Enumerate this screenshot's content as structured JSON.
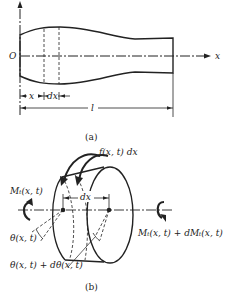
{
  "figure_a": {
    "caption": "(a)",
    "origin_label": "O",
    "axis_label": "x",
    "dim_x": "x",
    "dim_dx": "dx",
    "dim_length": "l"
  },
  "figure_b": {
    "caption": "(b)",
    "distributed_torque": "f(x, t) dx",
    "left_moment": "Mₜ(x, t)",
    "right_moment": "Mₜ(x, t) + dMₜ(x, t)",
    "element_length": "dx",
    "left_twist": "θ(x, t)",
    "right_twist": "θ(x, t) + dθ(x, t)"
  }
}
